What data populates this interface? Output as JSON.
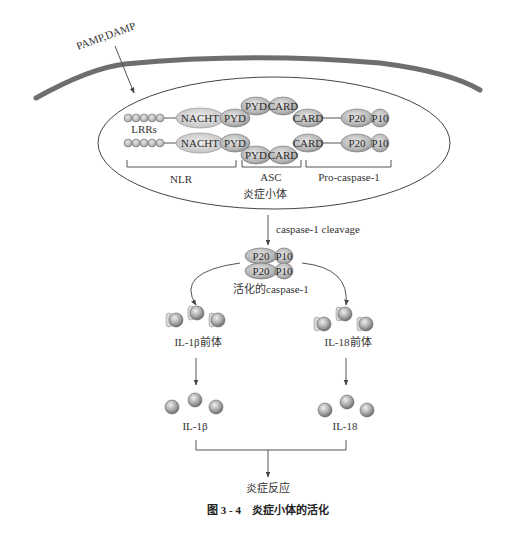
{
  "labels": {
    "pamp_damp": "PAMP,DAMP",
    "lrrs": "LRRs",
    "nacht": "NACHT",
    "pyd": "PYD",
    "card": "CARD",
    "p20": "P20",
    "p10": "P10",
    "nlr": "NLR",
    "asc": "ASC",
    "pro_caspase": "Pro-caspase-1",
    "inflammasome": "炎症小体",
    "cleavage": "caspase-1 cleavage",
    "active_caspase": "活化的caspase-1",
    "il1b_precursor": "IL-1β前体",
    "il18_precursor": "IL-18前体",
    "il1b": "IL-1β",
    "il18": "IL-18",
    "inflammation": "炎症反应",
    "caption": "图 3 - 4　炎症小体的活化"
  },
  "colors": {
    "membrane": "#6e6e6e",
    "protein_fill": "#b9b9b9",
    "protein_light": "#d4d4d4",
    "protein_stroke": "#6a6a6a",
    "text": "#333333"
  }
}
